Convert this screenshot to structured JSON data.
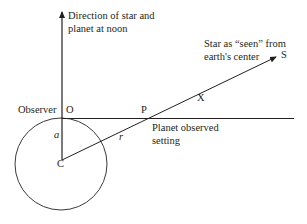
{
  "diagram": {
    "labels": {
      "noon_line1": "Direction of star and",
      "noon_line2": "planet at noon",
      "star_line1": "Star as “seen” from",
      "star_line2": "earth's center",
      "S": "S",
      "X": "X",
      "observer": "Observer",
      "O": "O",
      "P": "P",
      "a": "a",
      "r": "r",
      "C": "C",
      "setting_line1": "Planet observed",
      "setting_line2": "setting"
    },
    "colors": {
      "stroke": "#231f20",
      "circle": "#3a3a3a"
    }
  }
}
